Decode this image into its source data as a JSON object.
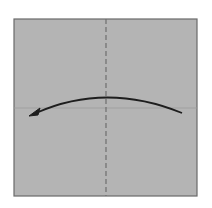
{
  "diagram": {
    "type": "origami-fold-instruction",
    "paper": {
      "x": 14,
      "y": 19,
      "width": 183,
      "height": 177,
      "fill": "#b4b4b4",
      "border": "#6a6a6a"
    },
    "crease_line": {
      "orientation": "horizontal",
      "y": 108,
      "color": "#9c9c9c"
    },
    "valley_fold_line": {
      "orientation": "vertical",
      "x": 106,
      "style": "dashed",
      "color": "#6e6e6e"
    },
    "fold_arrow": {
      "direction": "right-to-left",
      "start": [
        182,
        113
      ],
      "control": [
        106,
        82
      ],
      "end": [
        32,
        115
      ],
      "color": "#1e1e1e"
    }
  }
}
